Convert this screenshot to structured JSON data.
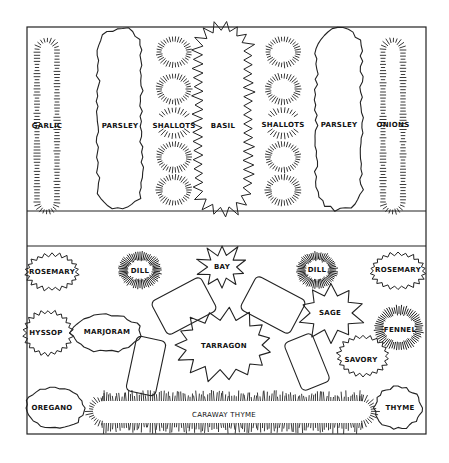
{
  "diagram": {
    "type": "herb garden planting plan",
    "frame": {
      "x": 27,
      "y": 27,
      "width": 399,
      "height": 407,
      "stroke": "#222222"
    },
    "sections": {
      "top_bed": {
        "y1": 27,
        "y2": 211
      },
      "path": {
        "y1": 211,
        "y2": 246
      },
      "bottom_bed": {
        "y1": 246,
        "y2": 434
      }
    },
    "top_bed_plants": [
      {
        "label": "GARLIC",
        "style": "tufted-row",
        "cx": 47,
        "cy": 126,
        "w": 26,
        "h": 176
      },
      {
        "label": "PARSLEY",
        "style": "wavy-row",
        "cx": 120,
        "cy": 119,
        "w": 42,
        "h": 180
      },
      {
        "label": "SHALLOTS",
        "style": "tufted-clumps",
        "cx": 174,
        "cy": 126,
        "count": 5
      },
      {
        "label": "BASIL",
        "style": "zigzag-row",
        "cx": 223,
        "cy": 119,
        "w": 44,
        "h": 180
      },
      {
        "label": "SHALLOTS",
        "style": "tufted-clumps",
        "cx": 283,
        "cy": 126,
        "count": 5
      },
      {
        "label": "PARSLEY",
        "style": "wavy-row",
        "cx": 339,
        "cy": 119,
        "w": 44,
        "h": 180
      },
      {
        "label": "ONIONS",
        "style": "tufted-row",
        "cx": 393,
        "cy": 126,
        "w": 26,
        "h": 176
      }
    ],
    "bottom_bed_plants": [
      {
        "label": "ROSEMARY",
        "style": "zigzag",
        "cx": 52,
        "cy": 272,
        "rx": 24,
        "ry": 16
      },
      {
        "label": "DILL",
        "style": "spiky",
        "cx": 140,
        "cy": 270,
        "rx": 20,
        "ry": 17
      },
      {
        "label": "BAY",
        "style": "star",
        "cx": 222,
        "cy": 267,
        "rx": 20,
        "ry": 18
      },
      {
        "label": "DILL",
        "style": "spiky",
        "cx": 317,
        "cy": 270,
        "rx": 19,
        "ry": 17
      },
      {
        "label": "ROSEMARY",
        "style": "zigzag",
        "cx": 398,
        "cy": 271,
        "rx": 25,
        "ry": 16
      },
      {
        "label": "SAGE",
        "style": "star",
        "cx": 331,
        "cy": 313,
        "rx": 27,
        "ry": 24
      },
      {
        "label": "HYSSOP",
        "style": "zigzag",
        "cx": 48,
        "cy": 333,
        "rx": 22,
        "ry": 20
      },
      {
        "label": "MARJORAM",
        "style": "cloud",
        "cx": 106,
        "cy": 333,
        "rx": 34,
        "ry": 18
      },
      {
        "label": "TARRAGON",
        "style": "star",
        "cx": 224,
        "cy": 345,
        "rx": 44,
        "ry": 31
      },
      {
        "label": "FENNEL",
        "style": "spiky",
        "cx": 399,
        "cy": 328,
        "rx": 23,
        "ry": 21
      },
      {
        "label": "SAVORY",
        "style": "zigzag",
        "cx": 363,
        "cy": 356,
        "rx": 23,
        "ry": 18
      },
      {
        "label": "OREGANO",
        "style": "cloud",
        "cx": 55,
        "cy": 408,
        "rx": 28,
        "ry": 20
      },
      {
        "label": "CARAWAY THYME",
        "style": "grass-border",
        "cx": 232,
        "cy": 411,
        "rx": 140,
        "ry": 16
      },
      {
        "label": "THYME",
        "style": "cloud",
        "cx": 398,
        "cy": 408,
        "rx": 23,
        "ry": 20
      }
    ],
    "stepping_stones": [
      {
        "cx": 184,
        "cy": 306,
        "w": 56,
        "h": 38,
        "angle": -28
      },
      {
        "cx": 146,
        "cy": 366,
        "w": 30,
        "h": 56,
        "angle": 12
      },
      {
        "cx": 273,
        "cy": 305,
        "w": 56,
        "h": 38,
        "angle": 28
      },
      {
        "cx": 307,
        "cy": 362,
        "w": 30,
        "h": 52,
        "angle": -22
      }
    ]
  }
}
